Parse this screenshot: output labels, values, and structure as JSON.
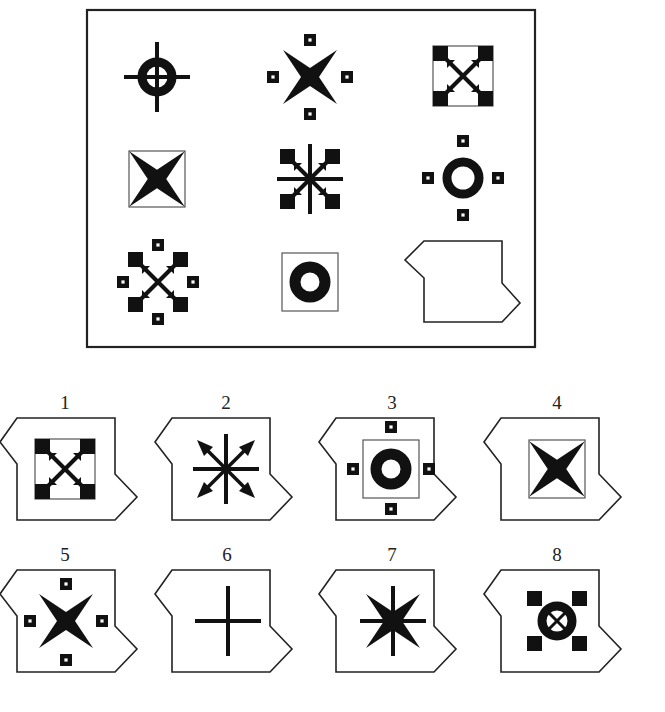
{
  "puzzle": {
    "type": "matrix-reasoning",
    "rows": 3,
    "cols": 3,
    "cells": [
      {
        "row": 1,
        "col": 1,
        "figure": "crosshair-ring",
        "frame": "none",
        "dots": false
      },
      {
        "row": 1,
        "col": 2,
        "figure": "four-point-star",
        "frame": "none",
        "dots": true
      },
      {
        "row": 1,
        "col": 3,
        "figure": "diagonal-arrows-corners",
        "frame": "square",
        "dots": false
      },
      {
        "row": 2,
        "col": 1,
        "figure": "four-point-star",
        "frame": "square",
        "dots": false
      },
      {
        "row": 2,
        "col": 2,
        "figure": "diagonal-arrows-corners-with-cross",
        "frame": "none",
        "dots": false
      },
      {
        "row": 2,
        "col": 3,
        "figure": "ring",
        "frame": "none",
        "dots": true
      },
      {
        "row": 3,
        "col": 1,
        "figure": "diagonal-arrows-corners",
        "frame": "none",
        "dots": true
      },
      {
        "row": 3,
        "col": 2,
        "figure": "ring",
        "frame": "square",
        "dots": false
      },
      {
        "row": 3,
        "col": 3,
        "figure": "missing-piece-placeholder",
        "frame": "none",
        "dots": false
      }
    ]
  },
  "options": [
    {
      "label": "1",
      "figure": "diagonal-arrows-corners",
      "frame": "square",
      "dots": false
    },
    {
      "label": "2",
      "figure": "diagonal-arrows-with-cross",
      "frame": "none",
      "dots": false
    },
    {
      "label": "3",
      "figure": "ring",
      "frame": "square",
      "dots": true
    },
    {
      "label": "4",
      "figure": "four-point-star",
      "frame": "square",
      "dots": false
    },
    {
      "label": "5",
      "figure": "four-point-star",
      "frame": "none",
      "dots": true
    },
    {
      "label": "6",
      "figure": "plus-cross",
      "frame": "none",
      "dots": false
    },
    {
      "label": "7",
      "figure": "star-with-cross",
      "frame": "none",
      "dots": false
    },
    {
      "label": "8",
      "figure": "ring-crosshair-corners",
      "frame": "none",
      "dots": false
    }
  ],
  "colors": {
    "ink": "#111111",
    "paper": "#ffffff",
    "frame_line": "#555555"
  }
}
